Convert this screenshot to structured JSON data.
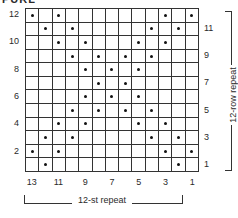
{
  "title": "PURL",
  "chart": {
    "columns": 13,
    "rows": 12,
    "symbol": "dot",
    "dots_by_row": {
      "12": [
        1,
        3,
        11,
        13
      ],
      "11": [
        2,
        4,
        10,
        12
      ],
      "10": [
        3,
        5,
        9,
        11
      ],
      "9": [
        4,
        6,
        8,
        10
      ],
      "8": [
        5,
        7,
        9
      ],
      "7": [
        6,
        8
      ],
      "6": [
        5,
        7,
        9
      ],
      "5": [
        4,
        6,
        8,
        10
      ],
      "4": [
        3,
        5,
        9,
        11
      ],
      "3": [
        2,
        4,
        10,
        12
      ],
      "2": [
        1,
        3,
        11,
        13
      ],
      "1": [
        2,
        12
      ]
    },
    "left_row_labels": [
      "12",
      "10",
      "8",
      "6",
      "4",
      "2"
    ],
    "right_row_labels": [
      "11",
      "9",
      "7",
      "5",
      "3",
      "1"
    ],
    "column_labels": [
      "13",
      "11",
      "9",
      "7",
      "5",
      "3",
      "1"
    ],
    "stitch_repeat_label": "12-st repeat",
    "row_repeat_label": "12-row repeat"
  }
}
